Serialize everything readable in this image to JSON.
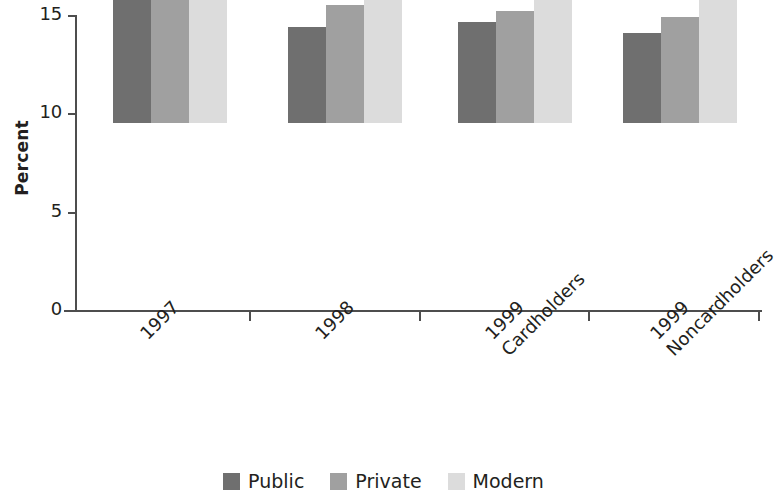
{
  "chart_data": {
    "type": "bar",
    "title": "",
    "subtitle": "",
    "xlabel": "",
    "ylabel": "Percent",
    "ylim": [
      0,
      15
    ],
    "yticks": [
      0,
      5,
      10,
      15
    ],
    "ytick_labels": [
      "0",
      "5",
      "10",
      "15"
    ],
    "grid": false,
    "legend_position": "bottom",
    "categories": [
      "1997",
      "1998",
      "1999 Cardholders",
      "1999 Noncardholders"
    ],
    "category_lines": [
      [
        "1997"
      ],
      [
        "1998"
      ],
      [
        "1999",
        "Cardholders"
      ],
      [
        "1999",
        "Noncardholders"
      ]
    ],
    "series": [
      {
        "name": "Public",
        "color": "#6f6f6f",
        "values": [
          6.65,
          4.9,
          5.15,
          4.6
        ]
      },
      {
        "name": "Private",
        "color": "#a0a0a0",
        "values": [
          6.65,
          6.0,
          5.7,
          5.4
        ]
      },
      {
        "name": "Modern",
        "color": "#dcdcdc",
        "values": [
          12.8,
          10.4,
          10.35,
          9.7
        ]
      }
    ]
  },
  "legend": {
    "items": [
      {
        "label": "Public",
        "swatch": "public"
      },
      {
        "label": "Private",
        "swatch": "private"
      },
      {
        "label": "Modern",
        "swatch": "modern"
      }
    ]
  },
  "axis": {
    "y_title": "Percent",
    "y_tick_labels": [
      "15",
      "10",
      "5",
      "0"
    ]
  },
  "colors": {
    "public": "#6f6f6f",
    "private": "#a0a0a0",
    "modern": "#dcdcdc",
    "axis": "#4d4d4d",
    "text": "#231f20",
    "background": "#ffffff"
  }
}
